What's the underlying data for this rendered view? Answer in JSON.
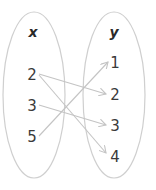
{
  "diagram": {
    "type": "mapping-diagram",
    "domain_set": {
      "label": "x",
      "values": [
        "2",
        "3",
        "5"
      ]
    },
    "range_set": {
      "label": "y",
      "values": [
        "1",
        "2",
        "3",
        "4"
      ]
    },
    "mappings": [
      {
        "from": "2",
        "to": "2"
      },
      {
        "from": "2",
        "to": "4"
      },
      {
        "from": "3",
        "to": "3"
      },
      {
        "from": "5",
        "to": "1"
      }
    ],
    "colors": {
      "oval_stroke": "#cfcfcf",
      "arrow_stroke": "#c4c4c4",
      "text": "#3a3a3a"
    }
  }
}
